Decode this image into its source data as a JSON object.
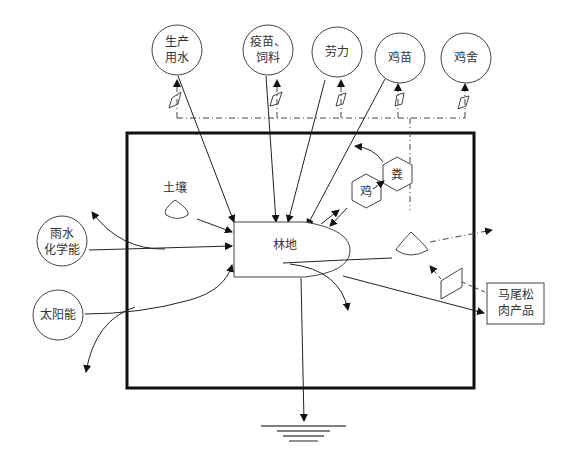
{
  "diagram": {
    "title": "",
    "inputs_top": [
      {
        "id": "water",
        "label": "生产\n用水"
      },
      {
        "id": "vaccine_feed",
        "label": "疫苗、\n饲料"
      },
      {
        "id": "labor",
        "label": "劳力"
      },
      {
        "id": "chick",
        "label": "鸡苗"
      },
      {
        "id": "coop",
        "label": "鸡舍"
      }
    ],
    "inputs_left": [
      {
        "id": "rain",
        "label": "雨水\n化学能"
      },
      {
        "id": "solar",
        "label": "太阳能"
      }
    ],
    "internal": {
      "soil": "土壤",
      "forest": "林地",
      "chicken": "鸡",
      "manure": "粪"
    },
    "output": {
      "label": "马尾松\n肉产品"
    },
    "heat_sink": "heat-sink"
  }
}
